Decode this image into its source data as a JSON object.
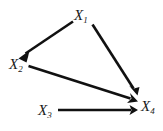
{
  "diagram": {
    "type": "directed-acyclic-graph",
    "background_color": "#ffffff",
    "edge_color": "#111111",
    "label_color": "#1a1a1a",
    "nodes": [
      {
        "id": "X1",
        "var": "X",
        "subscript": "1",
        "label": "X1",
        "x": 83,
        "y": 16
      },
      {
        "id": "X2",
        "var": "X",
        "subscript": "2",
        "label": "X2",
        "x": 18,
        "y": 65
      },
      {
        "id": "X3",
        "var": "X",
        "subscript": "3",
        "label": "X3",
        "x": 47,
        "y": 111
      },
      {
        "id": "X4",
        "var": "X",
        "subscript": "4",
        "label": "X4",
        "x": 150,
        "y": 107
      }
    ],
    "edges": [
      {
        "id": "e1",
        "from": "X1",
        "to": "X2",
        "x1": 74,
        "y1": 22,
        "x2": 22,
        "y2": 56
      },
      {
        "id": "e2",
        "from": "X1",
        "to": "X4",
        "x1": 92,
        "y1": 24,
        "x2": 136,
        "y2": 93
      },
      {
        "id": "e3",
        "from": "X2",
        "to": "X4",
        "x1": 28,
        "y1": 66,
        "x2": 137,
        "y2": 101
      },
      {
        "id": "e4",
        "from": "X3",
        "to": "X4",
        "x1": 58,
        "y1": 110,
        "x2": 137,
        "y2": 110
      }
    ]
  }
}
